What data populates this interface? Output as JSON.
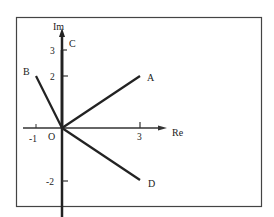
{
  "diagram": {
    "axes": {
      "x_label": "Re",
      "y_label": "Im",
      "origin_label": "O"
    },
    "ticks": {
      "x": [
        {
          "value": -1,
          "label": "-1"
        },
        {
          "value": 3,
          "label": "3"
        }
      ],
      "y": [
        {
          "value": 3,
          "label": "3"
        },
        {
          "value": 2,
          "label": "2"
        },
        {
          "value": -2,
          "label": "-2"
        }
      ]
    },
    "points": [
      {
        "name": "A",
        "re": 3,
        "im": 2
      },
      {
        "name": "B",
        "re": -1,
        "im": 2
      },
      {
        "name": "C",
        "re": 0,
        "im": 3
      },
      {
        "name": "D",
        "re": 3,
        "im": -2
      }
    ]
  }
}
